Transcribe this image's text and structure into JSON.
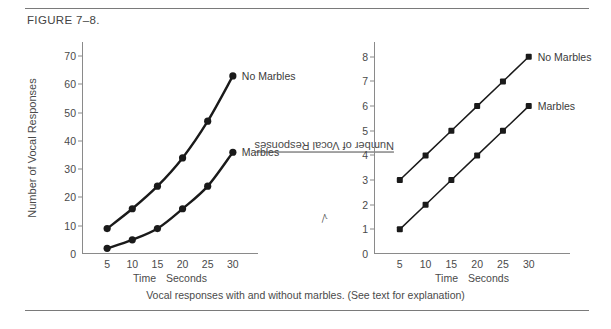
{
  "figure": {
    "title": "FIGURE 7–8.",
    "caption": "Vocal responses with and without marbles. (See text for explanation)"
  },
  "chart_data": [
    {
      "type": "line",
      "panel": "left",
      "title": "",
      "xlabel_parts": [
        "Time",
        "Seconds"
      ],
      "ylabel": "Number of Vocal Responses",
      "x": [
        5,
        10,
        15,
        20,
        25,
        30
      ],
      "xticks": [
        "5",
        "10",
        "15",
        "20",
        "25",
        "30"
      ],
      "yticks": [
        "0",
        "10",
        "20",
        "30",
        "40",
        "50",
        "60",
        "70"
      ],
      "xlim": [
        0,
        35
      ],
      "ylim": [
        0,
        75
      ],
      "grid": false,
      "legend_position": "right-of-last-point",
      "series": [
        {
          "name": "No Marbles",
          "values": [
            9,
            16,
            24,
            34,
            47,
            63
          ]
        },
        {
          "name": "Marbles",
          "values": [
            2,
            5,
            9,
            16,
            24,
            36
          ]
        }
      ]
    },
    {
      "type": "line",
      "panel": "right",
      "title": "",
      "xlabel_parts": [
        "Time",
        "Seconds"
      ],
      "ylabel": "Number of Vocal Responses",
      "ylabel_prefix": "√",
      "x": [
        5,
        10,
        15,
        20,
        25,
        30
      ],
      "xticks": [
        "5",
        "10",
        "15",
        "20",
        "25",
        "30"
      ],
      "yticks": [
        "0",
        "1",
        "2",
        "3",
        "4",
        "5",
        "6",
        "7",
        "8"
      ],
      "xlim": [
        0,
        38
      ],
      "ylim": [
        0,
        8.6
      ],
      "grid": false,
      "legend_position": "right-of-last-point",
      "series": [
        {
          "name": "No Marbles",
          "values": [
            3,
            4,
            5,
            6,
            7,
            8
          ]
        },
        {
          "name": "Marbles",
          "values": [
            1,
            2,
            3,
            4,
            5,
            6
          ]
        }
      ]
    }
  ],
  "style": {
    "ink": "#1a1a1a",
    "axis": "#8a8a8a",
    "text": "#4a4a4a"
  }
}
